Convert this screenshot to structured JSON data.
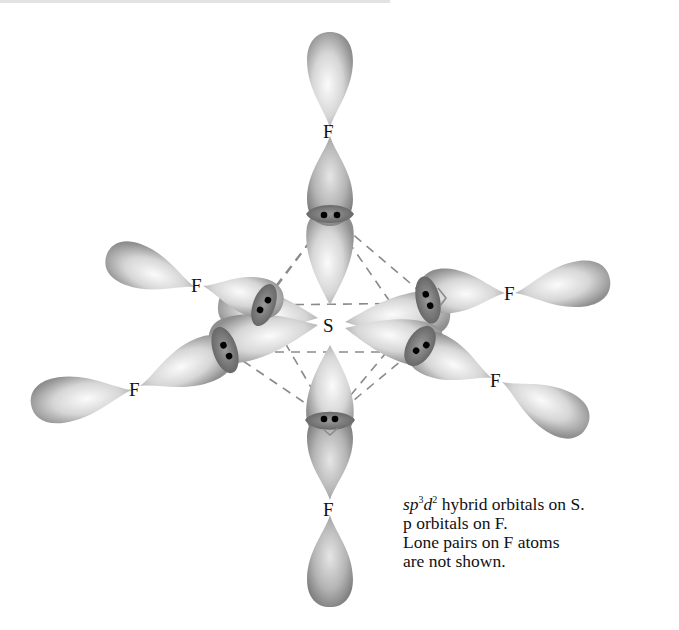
{
  "figure": {
    "central_atom": {
      "label": "S"
    },
    "ligands": [
      {
        "id": "top",
        "label": "F"
      },
      {
        "id": "upper-left",
        "label": "F"
      },
      {
        "id": "lower-left",
        "label": "F"
      },
      {
        "id": "upper-right",
        "label": "F"
      },
      {
        "id": "lower-right",
        "label": "F"
      },
      {
        "id": "bottom",
        "label": "F"
      }
    ],
    "bond_overlap_electrons_per_bond": 2,
    "colors": {
      "lobe_light": "#f4f4f4",
      "lobe_dark": "#8c8c8c",
      "overlap": "#6e6e6e",
      "dashed_edges": "#8a8a8a",
      "text": "#111111"
    }
  },
  "caption": {
    "line1_italic_a": "sp",
    "line1_sup_a": "3",
    "line1_italic_b": "d",
    "line1_sup_b": "2",
    "line1_rest": " hybrid orbitals on S.",
    "line2": "p orbitals on F.",
    "line3": "Lone pairs on F atoms",
    "line4": "are not shown."
  }
}
